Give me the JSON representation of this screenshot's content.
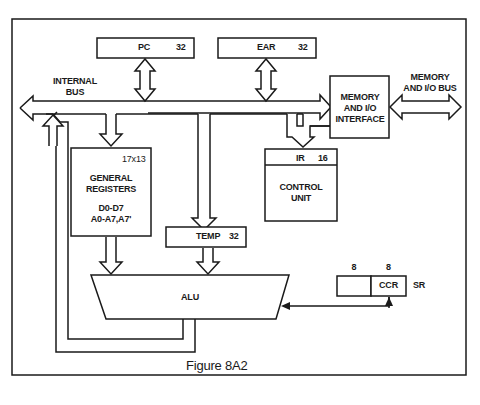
{
  "figure": {
    "caption": "Figure 8A2",
    "colors": {
      "line": "#1a1a1a",
      "background": "#ffffff"
    }
  },
  "labels": {
    "internal_bus_1": "INTERNAL",
    "internal_bus_2": "BUS",
    "mem_bus_1": "MEMORY",
    "mem_bus_2": "AND I/O BUS"
  },
  "blocks": {
    "pc": {
      "name": "PC",
      "width": "32"
    },
    "ear": {
      "name": "EAR",
      "width": "32"
    },
    "mem_interface": {
      "line1": "MEMORY",
      "line2": "AND I/O",
      "line3": "INTERFACE"
    },
    "general_registers": {
      "size": "17x13",
      "line1": "GENERAL",
      "line2": "REGISTERS",
      "line3": "D0-D7",
      "line4": "A0-A7,A7'"
    },
    "ir": {
      "name": "IR",
      "width": "16"
    },
    "control_unit": {
      "line1": "CONTROL",
      "line2": "UNIT"
    },
    "temp": {
      "name": "TEMP",
      "width": "32"
    },
    "alu": {
      "name": "ALU"
    },
    "sr": {
      "name": "SR",
      "upper_width": "8",
      "lower_width": "8",
      "ccr": "CCR"
    }
  }
}
